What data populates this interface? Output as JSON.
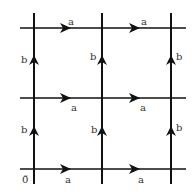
{
  "diagram": {
    "type": "lattice-grid",
    "line_color": "#111111",
    "label_color": "#333333",
    "grid": {
      "x": [
        34,
        102,
        171
      ],
      "y": [
        28,
        98,
        169
      ]
    },
    "origin_label": "0̃",
    "horizontal_label": "a",
    "vertical_label": "b",
    "horizontal_edges": [
      {
        "row": 0,
        "col": 0,
        "label": "a",
        "label_pos": "above"
      },
      {
        "row": 0,
        "col": 1,
        "label": "a",
        "label_pos": "above"
      },
      {
        "row": 1,
        "col": 0,
        "label": "a",
        "label_pos": "below"
      },
      {
        "row": 1,
        "col": 1,
        "label": "a",
        "label_pos": "below"
      },
      {
        "row": 2,
        "col": 0,
        "label": "a",
        "label_pos": "below"
      },
      {
        "row": 2,
        "col": 1,
        "label": "a",
        "label_pos": "below"
      }
    ],
    "vertical_edges": [
      {
        "col": 0,
        "row": 0,
        "label": "b"
      },
      {
        "col": 1,
        "row": 0,
        "label": "b"
      },
      {
        "col": 2,
        "row": 0,
        "label": "b"
      },
      {
        "col": 0,
        "row": 1,
        "label": "b"
      },
      {
        "col": 1,
        "row": 1,
        "label": "b"
      },
      {
        "col": 2,
        "row": 1,
        "label": "b"
      }
    ]
  }
}
